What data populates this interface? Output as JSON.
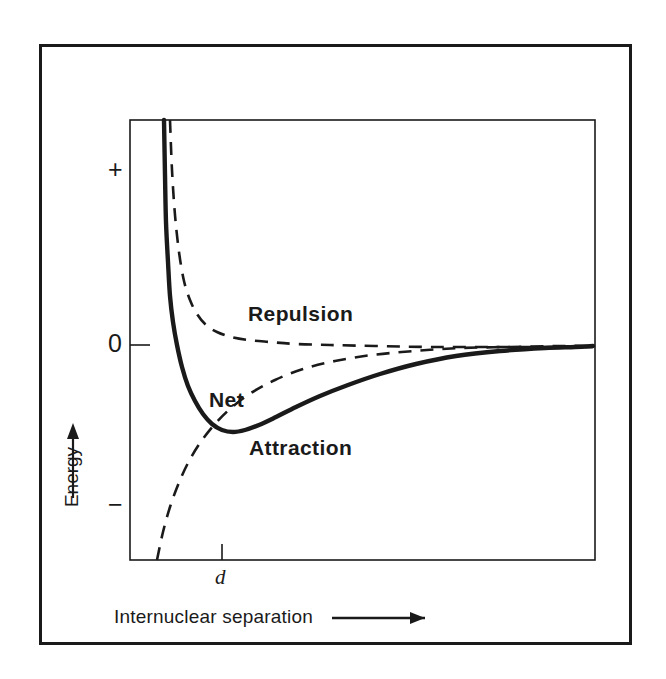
{
  "figure": {
    "kind": "potential-energy-diagram",
    "border_color": "#1a1a1a",
    "curve_color": "#1a1a1a",
    "background": "#ffffff"
  },
  "axes": {
    "y_label": "Energy",
    "y_label_arrow": "↑",
    "x_label": "Internuclear separation",
    "x_label_arrow": "⟶",
    "y_ticks": [
      {
        "label": "+",
        "position_frac": 0.114
      },
      {
        "label": "0",
        "position_frac": 0.511
      },
      {
        "label": "−",
        "position_frac": 0.875
      }
    ],
    "x_ticks": [
      {
        "label": "d",
        "position_frac": 0.198
      }
    ]
  },
  "chart_data": {
    "type": "line",
    "title": "",
    "subtitle": "",
    "xlabel": "Internuclear separation",
    "ylabel": "Energy",
    "xlim": [
      0,
      1
    ],
    "ylim": [
      -1,
      1
    ],
    "grid": false,
    "legend": "inline-annotations",
    "x_tick_labels": [
      "d"
    ],
    "y_tick_labels": [
      "+",
      "0",
      "−"
    ],
    "annotations": [
      {
        "text": "Repulsion",
        "x_px": 248,
        "y_px": 313
      },
      {
        "text": "Net",
        "x_px": 209,
        "y_px": 399
      },
      {
        "text": "Attraction",
        "x_px": 249,
        "y_px": 447
      },
      {
        "text": "d",
        "x_px": 216,
        "y_px": 577
      }
    ],
    "series": [
      {
        "name": "Repulsion",
        "style": "dashed",
        "width": 2.6,
        "description": "Positive repulsive potential decaying as 1/r toward zero",
        "points": [
          [
            170,
            120
          ],
          [
            172,
            170
          ],
          [
            175,
            215
          ],
          [
            179,
            252
          ],
          [
            184,
            281
          ],
          [
            190,
            300
          ],
          [
            197,
            314
          ],
          [
            206,
            325
          ],
          [
            217,
            332
          ],
          [
            231,
            337
          ],
          [
            248,
            340
          ],
          [
            270,
            342
          ],
          [
            296,
            344
          ],
          [
            330,
            345
          ],
          [
            375,
            346
          ],
          [
            430,
            347
          ],
          [
            490,
            347
          ],
          [
            560,
            347
          ],
          [
            593,
            347
          ]
        ]
      },
      {
        "name": "Attraction",
        "style": "dashed",
        "width": 2.6,
        "description": "Negative attractive potential rising as -1/r toward zero",
        "points": [
          [
            157,
            560
          ],
          [
            163,
            532
          ],
          [
            170,
            507
          ],
          [
            178,
            485
          ],
          [
            188,
            463
          ],
          [
            200,
            443
          ],
          [
            214,
            425
          ],
          [
            231,
            408
          ],
          [
            251,
            393
          ],
          [
            275,
            380
          ],
          [
            303,
            369
          ],
          [
            335,
            361
          ],
          [
            372,
            355
          ],
          [
            414,
            351
          ],
          [
            460,
            348
          ],
          [
            510,
            347
          ],
          [
            560,
            346
          ],
          [
            593,
            346
          ]
        ]
      },
      {
        "name": "Net",
        "style": "solid",
        "width": 4.4,
        "description": "Sum of repulsion and attraction; minimum at bond distance d",
        "points": [
          [
            164,
            120
          ],
          [
            165,
            175
          ],
          [
            166,
            222
          ],
          [
            168,
            262
          ],
          [
            170,
            296
          ],
          [
            173,
            322
          ],
          [
            177,
            345
          ],
          [
            182,
            367
          ],
          [
            188,
            386
          ],
          [
            195,
            401
          ],
          [
            203,
            414
          ],
          [
            212,
            424
          ],
          [
            222,
            430
          ],
          [
            233,
            432
          ],
          [
            245,
            430
          ],
          [
            259,
            425
          ],
          [
            276,
            417
          ],
          [
            296,
            407
          ],
          [
            320,
            396
          ],
          [
            348,
            385
          ],
          [
            380,
            374
          ],
          [
            416,
            364
          ],
          [
            456,
            356
          ],
          [
            500,
            351
          ],
          [
            545,
            348
          ],
          [
            575,
            347
          ],
          [
            593,
            346
          ]
        ]
      }
    ]
  },
  "series_labels": {
    "repulsion": "Repulsion",
    "attraction": "Attraction",
    "net": "Net",
    "bond_distance": "d"
  }
}
